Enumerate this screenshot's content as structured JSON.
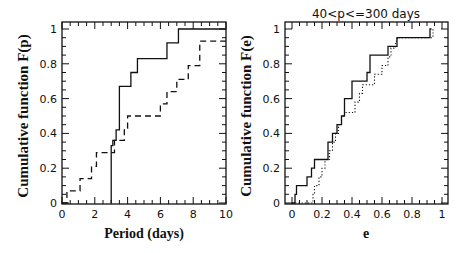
{
  "chart_data": [
    {
      "type": "line",
      "title": "",
      "xlabel": "Period (days)",
      "ylabel": "Cumulative function F(p)",
      "xlim": [
        0,
        10
      ],
      "ylim": [
        0,
        1
      ],
      "xticks": [
        "0",
        "2",
        "4",
        "6",
        "8",
        "10"
      ],
      "yticks": [
        "0",
        "0.2",
        "0.4",
        "0.6",
        "0.8",
        "1"
      ],
      "grid": false,
      "step": true,
      "series": [
        {
          "name": "solid",
          "style": "solid",
          "x": [
            3.0,
            3.0,
            3.1,
            3.3,
            3.5,
            4.2,
            4.6,
            6.4,
            7.1,
            10.0
          ],
          "y": [
            0.0,
            0.33,
            0.36,
            0.42,
            0.67,
            0.75,
            0.83,
            0.92,
            1.0,
            1.0
          ]
        },
        {
          "name": "dashed",
          "style": "dashed",
          "x": [
            0.0,
            0.3,
            1.1,
            1.8,
            2.1,
            3.0,
            3.2,
            3.8,
            4.0,
            6.0,
            6.4,
            7.0,
            7.7,
            8.4,
            10.0
          ],
          "y": [
            0.0,
            0.07,
            0.14,
            0.21,
            0.29,
            0.29,
            0.36,
            0.43,
            0.5,
            0.57,
            0.64,
            0.71,
            0.79,
            0.93,
            0.93
          ]
        }
      ]
    },
    {
      "type": "line",
      "title": "40<p<=300 days",
      "xlabel": "e",
      "ylabel": "Cumulative function F(e)",
      "xlim": [
        0,
        1
      ],
      "ylim": [
        0,
        1
      ],
      "xticks": [
        "0",
        "0.2",
        "0.4",
        "0.6",
        "0.8",
        "1"
      ],
      "yticks": [
        "0",
        "0.2",
        "0.4",
        "0.6",
        "0.8",
        "1"
      ],
      "grid": false,
      "step": true,
      "series": [
        {
          "name": "solid",
          "style": "solid",
          "x": [
            0.0,
            0.02,
            0.03,
            0.1,
            0.13,
            0.15,
            0.24,
            0.27,
            0.3,
            0.33,
            0.35,
            0.4,
            0.5,
            0.52,
            0.64,
            0.7,
            0.92,
            0.93
          ],
          "y": [
            0.0,
            0.05,
            0.1,
            0.15,
            0.2,
            0.25,
            0.35,
            0.4,
            0.45,
            0.5,
            0.6,
            0.7,
            0.75,
            0.85,
            0.9,
            0.95,
            1.0,
            1.0
          ]
        },
        {
          "name": "dotted",
          "style": "dotted",
          "x": [
            0.0,
            0.14,
            0.15,
            0.18,
            0.2,
            0.22,
            0.25,
            0.27,
            0.29,
            0.31,
            0.33,
            0.35,
            0.37,
            0.42,
            0.45,
            0.47,
            0.49,
            0.55,
            0.6,
            0.64,
            0.66,
            0.69,
            0.7,
            0.94,
            0.95
          ],
          "y": [
            0.0,
            0.05,
            0.1,
            0.15,
            0.2,
            0.25,
            0.3,
            0.35,
            0.4,
            0.45,
            0.5,
            0.52,
            0.52,
            0.58,
            0.63,
            0.68,
            0.68,
            0.74,
            0.79,
            0.84,
            0.89,
            0.93,
            0.95,
            1.0,
            1.0
          ]
        }
      ]
    }
  ],
  "panels": [
    {
      "ylabel": "Cumulative function F(p)",
      "xlabel": "Period (days)",
      "title": ""
    },
    {
      "ylabel": "Cumulative function F(e)",
      "xlabel": "e",
      "title": "40<p<=300 days"
    }
  ]
}
